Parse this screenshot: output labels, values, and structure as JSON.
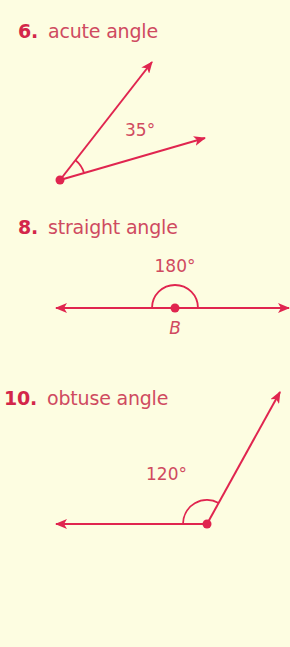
{
  "problems": [
    {
      "number": "6.",
      "label": "acute angle",
      "measure": "35°",
      "vertex_label": ""
    },
    {
      "number": "8.",
      "label": "straight angle",
      "measure": "180°",
      "vertex_label": "B"
    },
    {
      "number": "10.",
      "label": "obtuse angle",
      "measure": "120°",
      "vertex_label": ""
    }
  ],
  "colors": {
    "background": "#fdfde1",
    "line": "#e0254f",
    "number": "#d3264a",
    "text": "#cf4a60"
  }
}
